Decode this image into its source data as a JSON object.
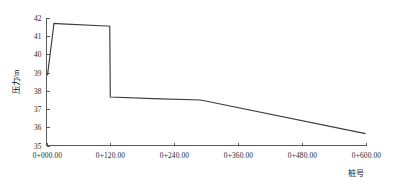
{
  "chart_data": {
    "type": "line",
    "title": "",
    "subtitle": "",
    "xlabel": "桩号",
    "ylabel": "压力/m",
    "xlim": [
      0,
      600
    ],
    "ylim": [
      35,
      42
    ],
    "grid": false,
    "legend": false,
    "legend_position": "none",
    "x_tick_labels": [
      "0+000.00",
      "0+120.00",
      "0+240.00",
      "0+360.00",
      "0+480.00",
      "0+600.00"
    ],
    "x_tick_values": [
      0,
      120,
      240,
      360,
      480,
      600
    ],
    "y_tick_labels": [
      "35",
      "36",
      "37",
      "38",
      "39",
      "40",
      "41",
      "42"
    ],
    "y_tick_values": [
      35,
      36,
      37,
      38,
      39,
      40,
      41,
      42
    ],
    "series": [
      {
        "name": "压力",
        "color": "#3c3c3c",
        "x": [
          0,
          2,
          14,
          28,
          112,
          119,
          120,
          200,
          290,
          600
        ],
        "values": [
          38.9,
          38.88,
          41.7,
          41.68,
          41.56,
          41.55,
          37.66,
          37.57,
          37.5,
          35.65
        ]
      }
    ],
    "annotations": []
  },
  "axis_style": {
    "axis_color": "#5a5a5a",
    "text_color": "#1f1f1f",
    "background": "#ffffff"
  }
}
